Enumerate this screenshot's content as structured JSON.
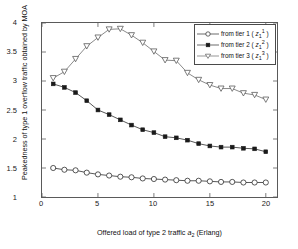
{
  "chart_data": {
    "type": "line",
    "title": "",
    "xlabel": "Offered load of type 2 traffic  a_2 (Erlang)",
    "ylabel": "Peakedness of type 1 overflow traffic obtained by MOA",
    "xlim": [
      0,
      21
    ],
    "ylim": [
      1,
      4
    ],
    "xticks": [
      0,
      5,
      10,
      15,
      20
    ],
    "yticks": [
      1,
      1.5,
      2,
      2.5,
      3,
      3.5,
      4
    ],
    "xtick_labels": [
      "0",
      "5",
      "10",
      "15",
      "20"
    ],
    "ytick_labels": [
      "1",
      "1.5",
      "2",
      "2.5",
      "3",
      "3.5",
      "4"
    ],
    "grid": false,
    "legend_position": "top-right",
    "x": [
      1,
      2,
      3,
      4,
      5,
      6,
      7,
      8,
      9,
      10,
      11,
      12,
      13,
      14,
      15,
      16,
      17,
      18,
      19,
      20
    ],
    "series": [
      {
        "name": "from tier 1 ( z_1^1 )",
        "marker": "open-circle",
        "color": "#2b2b2b",
        "values": [
          1.5,
          1.47,
          1.46,
          1.42,
          1.39,
          1.37,
          1.35,
          1.34,
          1.32,
          1.31,
          1.3,
          1.29,
          1.28,
          1.28,
          1.27,
          1.26,
          1.26,
          1.25,
          1.25,
          1.25
        ]
      },
      {
        "name": "from tier 2 ( z_1^2 )",
        "marker": "filled-square",
        "color": "#2b2b2b",
        "values": [
          2.95,
          2.89,
          2.8,
          2.66,
          2.5,
          2.42,
          2.33,
          2.24,
          2.16,
          2.11,
          2.04,
          2.02,
          1.98,
          1.92,
          1.88,
          1.86,
          1.86,
          1.84,
          1.83,
          1.78
        ]
      },
      {
        "name": "from tier 3 ( z_1^3 )",
        "marker": "open-down-triangle",
        "color": "#6b6b6b",
        "values": [
          3.05,
          3.16,
          3.38,
          3.6,
          3.75,
          3.89,
          3.9,
          3.79,
          3.66,
          3.51,
          3.36,
          3.35,
          3.14,
          3.02,
          2.93,
          2.87,
          2.87,
          2.79,
          2.76,
          2.68
        ]
      }
    ]
  },
  "legend": {
    "items": [
      {
        "prefix": "from tier 1 ( ",
        "symbol": "z",
        "sub": "1",
        "sup": "1",
        "suffix": " )"
      },
      {
        "prefix": "from tier 2 ( ",
        "symbol": "z",
        "sub": "1",
        "sup": "2",
        "suffix": " )"
      },
      {
        "prefix": "from tier 3 ( ",
        "symbol": "z",
        "sub": "1",
        "sup": "3",
        "suffix": " )"
      }
    ]
  },
  "axis": {
    "ylabel_text": "Peakedness of type 1 overflow traffic obtained by MOA",
    "xlabel_prefix": "Offered load of type 2 traffic  ",
    "xlabel_symbol": "a",
    "xlabel_sub": "2",
    "xlabel_suffix": " (Erlang)"
  }
}
